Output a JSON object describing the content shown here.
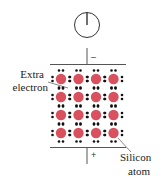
{
  "diagram": {
    "title": "",
    "meter": {
      "icon": "ammeter-dial",
      "needle": "vertical-up"
    },
    "terminals": {
      "top_sign": "–",
      "bottom_sign": "+"
    },
    "labels": {
      "extra_electron_line1": "Extra",
      "extra_electron_line2": "electron",
      "silicon_atom_line1": "Silicon",
      "silicon_atom_line2": "atom"
    },
    "lattice": {
      "rows": 4,
      "cols": 4,
      "atom_color": "#d9505f",
      "electron_color": "#111111",
      "plate_color": "#555555"
    }
  }
}
